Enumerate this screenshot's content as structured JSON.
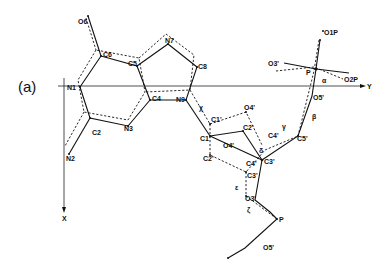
{
  "figure": {
    "panel_label": "(a)",
    "axes": {
      "x_label": "X",
      "y_label": "Y"
    },
    "atoms": {
      "O6": "O6",
      "C6": "C6",
      "C5": "C5",
      "N7": "N7",
      "C8": "C8",
      "N9": "N9",
      "C4": "C4",
      "N3": "N3",
      "C2": "C2",
      "N1": "N1",
      "N2": "N2",
      "C1p_dash": "C1'",
      "O4p_dash": "O4'",
      "C1": "C1'",
      "C2p": "C2'",
      "O4p": "O4'",
      "C2p_dash": "C2'",
      "C4p": "C4'",
      "C5p": "C5'",
      "C3p": "C3'",
      "C4p_dash": "C4'",
      "C3p_dash": "C3'",
      "O3p_low": "O3'",
      "P_low": "P",
      "O5p_low": "O5'",
      "P": "P",
      "O1P": "O1P",
      "O2P": "O2P",
      "O3p": "O3'",
      "O5p": "O5'"
    },
    "torsions": {
      "chi": "χ",
      "alpha": "α",
      "beta": "β",
      "gamma": "γ",
      "delta": "δ",
      "epsilon": "ε",
      "zeta": "ζ"
    }
  }
}
